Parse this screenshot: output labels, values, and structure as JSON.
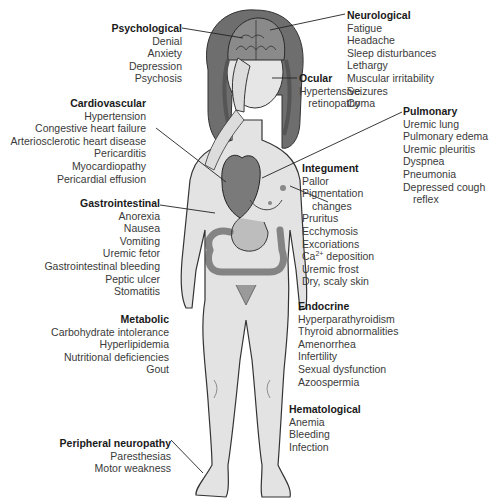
{
  "figure": {
    "organs_shown": [
      "brain",
      "heart",
      "stomach",
      "intestines"
    ]
  },
  "groups": {
    "psychological": {
      "title": "Psychological",
      "items": [
        "Denial",
        "Anxiety",
        "Depression",
        "Psychosis"
      ]
    },
    "neurological": {
      "title": "Neurological",
      "items": [
        "Fatigue",
        "Headache",
        "Sleep disturbances",
        "Lethargy",
        "Muscular irritability",
        "Seizures",
        "Coma"
      ]
    },
    "ocular": {
      "title": "Ocular",
      "items": [
        "Hypertensive",
        "retinopathy"
      ]
    },
    "cardiovascular": {
      "title": "Cardiovascular",
      "items": [
        "Hypertension",
        "Congestive heart failure",
        "Arteriosclerotic heart disease",
        "Pericarditis",
        "Myocardiopathy",
        "Pericardial effusion"
      ]
    },
    "pulmonary": {
      "title": "Pulmonary",
      "items": [
        "Uremic lung",
        "Pulmonary edema",
        "Uremic pleuritis",
        "Dyspnea",
        "Pneumonia",
        "Depressed cough",
        "reflex"
      ]
    },
    "integument": {
      "title": "Integument",
      "items": [
        "Pallor",
        "Pigmentation",
        "changes",
        "Pruritus",
        "Ecchymosis",
        "Excoriations",
        "Ca",
        "2+",
        " deposition",
        "Uremic frost",
        "Dry, scaly skin"
      ]
    },
    "gastrointestinal": {
      "title": "Gastrointestinal",
      "items": [
        "Anorexia",
        "Nausea",
        "Vomiting",
        "Uremic fetor",
        "Gastrointestinal bleeding",
        "Peptic ulcer",
        "Stomatitis"
      ]
    },
    "metabolic": {
      "title": "Metabolic",
      "items": [
        "Carbohydrate intolerance",
        "Hyperlipidemia",
        "Nutritional deficiencies",
        "Gout"
      ]
    },
    "endocrine": {
      "title": "Endocrine",
      "items": [
        "Hyperparathyroidism",
        "Thyroid abnormalities",
        "Amenorrhea",
        "Infertility",
        "Sexual dysfunction",
        "Azoospermia"
      ]
    },
    "hematological": {
      "title": "Hematological",
      "items": [
        "Anemia",
        "Bleeding",
        "Infection"
      ]
    },
    "peripheral": {
      "title": "Peripheral neuropathy",
      "items": [
        "Paresthesias",
        "Motor weakness"
      ]
    }
  }
}
